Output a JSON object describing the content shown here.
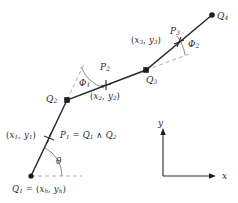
{
  "figure": {
    "background": "#ffffff",
    "stroke_color": "#2b2b2b",
    "dash_color": "#9a9a9a",
    "width": 238,
    "height": 203
  },
  "labels": {
    "q1": "Q",
    "q1_sub": "1",
    "q1_equals": " = (",
    "q1_coord_x": "x",
    "q1_coord_x_sub": "h",
    "q1_coord_sep": ", ",
    "q1_coord_y": "y",
    "q1_coord_y_sub": "h",
    "q1_close": ")",
    "q2": "Q",
    "q2_sub": "2",
    "q3": "Q",
    "q3_sub": "3",
    "q4": "Q",
    "q4_sub": "4",
    "p1": "P",
    "p1_sub": "1",
    "p1_equals": " = ",
    "p1_opA": "Q",
    "p1_opA_sub": "1",
    "p1_wedge": " ∧ ",
    "p1_opB": "Q",
    "p1_opB_sub": "2",
    "p2": "P",
    "p2_sub": "2",
    "p3": "P",
    "p3_sub": "3",
    "xy1_open": "(",
    "xy1_x": "x",
    "xy1_x_sub": "1",
    "xy1_sep": ", ",
    "xy1_y": "y",
    "xy1_y_sub": "1",
    "xy1_close": ")",
    "xy2_open": "(",
    "xy2_x": "x",
    "xy2_x_sub": "2",
    "xy2_sep": ", ",
    "xy2_y": "y",
    "xy2_y_sub": "2",
    "xy2_close": ")",
    "xy3_open": "(",
    "xy3_x": "x",
    "xy3_x_sub": "3",
    "xy3_sep": ", ",
    "xy3_y": "y",
    "xy3_y_sub": "3",
    "xy3_close": ")",
    "theta": "θ",
    "phi1": "Φ",
    "phi1_sub": "1",
    "phi2": "Φ",
    "phi2_sub": "2",
    "axis_y": "y",
    "axis_x": "x"
  },
  "geometry": {
    "vertices": [
      {
        "name": "Q1",
        "x": 31,
        "y": 176
      },
      {
        "name": "Q2",
        "x": 67,
        "y": 100
      },
      {
        "name": "Q3",
        "x": 146,
        "y": 70
      },
      {
        "name": "Q4",
        "x": 212,
        "y": 15
      }
    ],
    "midpoints": [
      {
        "name": "P1",
        "x": 49,
        "y": 138
      },
      {
        "name": "P2",
        "x": 106,
        "y": 85
      },
      {
        "name": "P3",
        "x": 179,
        "y": 42
      }
    ],
    "axis_origin": {
      "x": 163,
      "y": 176
    },
    "axis_y_tip": {
      "x": 163,
      "y": 130
    },
    "axis_x_tip": {
      "x": 215,
      "y": 176
    }
  }
}
